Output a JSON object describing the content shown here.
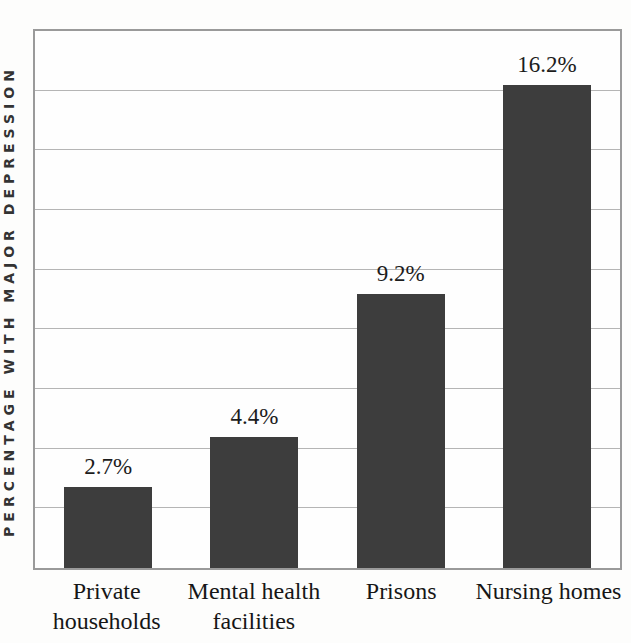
{
  "chart_data": {
    "type": "bar",
    "title": "",
    "xlabel": "",
    "ylabel": "PERCENTAGE WITH MAJOR DEPRESSION",
    "categories": [
      "Private households",
      "Mental health facilities",
      "Prisons",
      "Nursing homes"
    ],
    "category_lines": [
      [
        "Private",
        "households"
      ],
      [
        "Mental health",
        "facilities"
      ],
      [
        "Prisons"
      ],
      [
        "Nursing homes"
      ]
    ],
    "values": [
      2.7,
      4.4,
      9.2,
      16.2
    ],
    "value_labels": [
      "2.7%",
      "4.4%",
      "9.2%",
      "16.2%"
    ],
    "ylim": [
      0,
      18
    ],
    "gridline_step": 2,
    "grid": "horizontal",
    "y_tick_labels_shown": false,
    "legend_position": "none",
    "colors": {
      "bar": "#3d3d3d",
      "plot_border": "#9a9a9a",
      "gridline": "#b5b5b5",
      "label_text": "#1c1c1c",
      "background": "#fdfdfc",
      "plot_background": "#fefefe"
    }
  }
}
